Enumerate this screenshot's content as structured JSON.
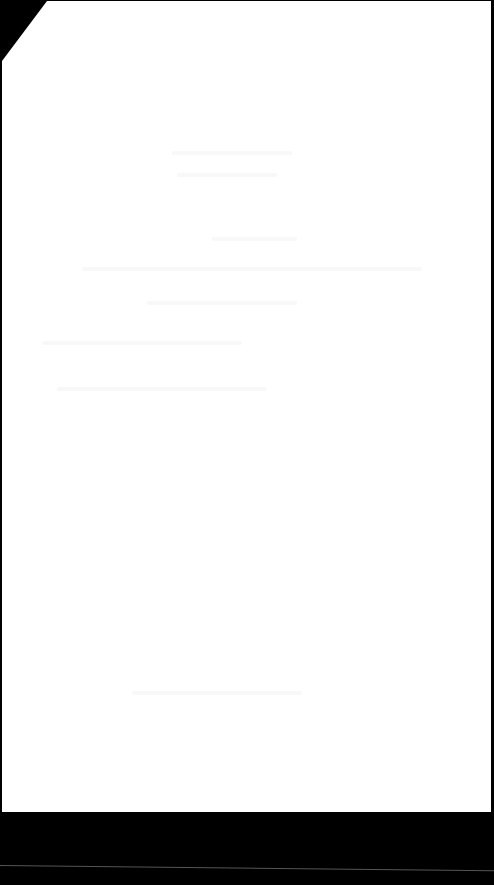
{
  "document": {
    "type": "scanned-page",
    "state": "blank (faint bleed-through, illegible)",
    "background_color": "#000000",
    "page_color": "#ffffff"
  },
  "ghost_lines": [
    {
      "x": 170,
      "y": 150,
      "w": 120
    },
    {
      "x": 175,
      "y": 172,
      "w": 100
    },
    {
      "x": 210,
      "y": 236,
      "w": 85
    },
    {
      "x": 80,
      "y": 266,
      "w": 340
    },
    {
      "x": 145,
      "y": 300,
      "w": 150
    },
    {
      "x": 40,
      "y": 340,
      "w": 200
    },
    {
      "x": 55,
      "y": 386,
      "w": 210
    },
    {
      "x": 130,
      "y": 690,
      "w": 170
    }
  ]
}
